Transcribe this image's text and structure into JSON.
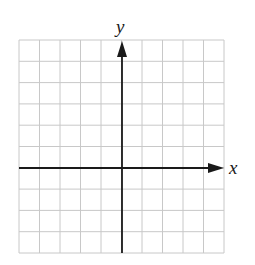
{
  "diagram": {
    "type": "coordinate-plane",
    "grid": {
      "columns": 10,
      "rows": 10,
      "left": 19,
      "top": 40,
      "right": 224,
      "bottom": 253,
      "line_color": "#c8c8c8"
    },
    "axes": {
      "color": "#1a1a1a",
      "origin_px": [
        122,
        168
      ],
      "x_label": "x",
      "y_label": "y"
    }
  }
}
